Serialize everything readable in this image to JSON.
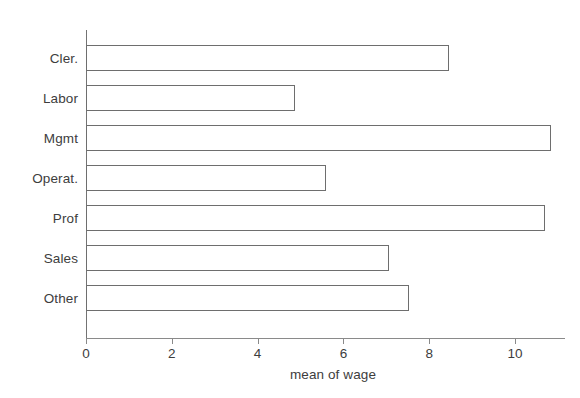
{
  "chart_data": {
    "type": "bar",
    "orientation": "horizontal",
    "title": "",
    "subtitle": "",
    "xlabel": "mean of wage",
    "ylabel": "",
    "categories": [
      "Cler.",
      "Labor",
      "Mgmt",
      "Operat.",
      "Prof",
      "Sales",
      "Other"
    ],
    "values": [
      8.46,
      4.87,
      10.84,
      5.59,
      10.7,
      7.06,
      7.53
    ],
    "series": [
      {
        "name": "mean of wage",
        "values": [
          8.46,
          4.87,
          10.84,
          5.59,
          10.7,
          7.06,
          7.53
        ]
      }
    ],
    "xlim": [
      0,
      11.2
    ],
    "xticks": [
      0,
      2,
      4,
      6,
      8,
      10
    ],
    "xtick_labels": [
      "0",
      "2",
      "4",
      "6",
      "8",
      "10"
    ],
    "ytick_labels": [
      "Cler.",
      "Labor",
      "Mgmt",
      "Operat.",
      "Prof",
      "Sales",
      "Other"
    ],
    "grid": false,
    "legend": false,
    "legend_position": "none",
    "annotations": [],
    "colors": {
      "bar_fill": "#ffffff",
      "bar_outline": "#6e6e6e",
      "axis": "#8a8a8a",
      "text": "#3d3d3d",
      "background": "#ffffff"
    }
  },
  "axis": {
    "x_title": "mean of wage",
    "ticks": [
      {
        "label": "0",
        "value": 0
      },
      {
        "label": "2",
        "value": 2
      },
      {
        "label": "4",
        "value": 4
      },
      {
        "label": "6",
        "value": 6
      },
      {
        "label": "8",
        "value": 8
      },
      {
        "label": "10",
        "value": 10
      }
    ]
  },
  "bars": [
    {
      "label": "Cler.",
      "value": 8.46
    },
    {
      "label": "Labor",
      "value": 4.87
    },
    {
      "label": "Mgmt",
      "value": 10.84
    },
    {
      "label": "Operat.",
      "value": 5.59
    },
    {
      "label": "Prof",
      "value": 10.7
    },
    {
      "label": "Sales",
      "value": 7.06
    },
    {
      "label": "Other",
      "value": 7.53
    }
  ]
}
